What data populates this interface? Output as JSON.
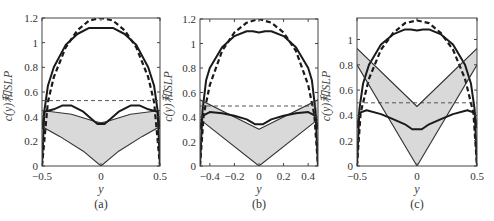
{
  "chart_data": [
    {
      "type": "line",
      "panel": "(a)",
      "xlabel": "y",
      "ylabel": "c(y)和SLP",
      "xlim": [
        -0.5,
        0.5
      ],
      "ylim": [
        0,
        1.2
      ],
      "xticks": [
        "-0.5",
        "0",
        "0.5"
      ],
      "yticks": [
        "0",
        "0.2",
        "0.4",
        "0.6",
        "0.8",
        "1",
        "1.2"
      ],
      "grid": false,
      "series": [
        {
          "name": "elliptic c(y) (dashed)",
          "style": "dashed-thick",
          "x": [
            -0.5,
            -0.45,
            -0.4,
            -0.3,
            -0.2,
            -0.1,
            0,
            0.1,
            0.2,
            0.3,
            0.4,
            0.45,
            0.5
          ],
          "y": [
            0,
            0.52,
            0.72,
            0.96,
            1.1,
            1.18,
            1.2,
            1.18,
            1.1,
            0.96,
            0.72,
            0.52,
            0
          ]
        },
        {
          "name": "c(y) (solid)",
          "style": "solid-thick",
          "x": [
            -0.5,
            -0.48,
            -0.45,
            -0.4,
            -0.3,
            -0.2,
            -0.1,
            0,
            0.1,
            0.2,
            0.3,
            0.4,
            0.45,
            0.48,
            0.5
          ],
          "y": [
            0,
            0.45,
            0.65,
            0.8,
            0.98,
            1.07,
            1.12,
            1.12,
            1.12,
            1.07,
            0.98,
            0.8,
            0.65,
            0.45,
            0
          ]
        },
        {
          "name": "mean SLP (dashed)",
          "style": "dashed-thin",
          "x": [
            -0.5,
            0.5
          ],
          "y": [
            0.53,
            0.53
          ]
        },
        {
          "name": "SLP band upper",
          "style": "solid-thin",
          "x": [
            -0.5,
            -0.25,
            -0.05,
            0,
            0.05,
            0.25,
            0.5
          ],
          "y": [
            0.45,
            0.42,
            0.36,
            0.35,
            0.36,
            0.42,
            0.45
          ]
        },
        {
          "name": "SLP band lower",
          "style": "solid-thin",
          "x": [
            -0.5,
            -0.35,
            -0.15,
            0,
            0.15,
            0.35,
            0.5
          ],
          "y": [
            0.32,
            0.24,
            0.12,
            0,
            0.12,
            0.24,
            0.32
          ]
        },
        {
          "name": "SLP (thick)",
          "style": "solid-thick",
          "x": [
            -0.5,
            -0.48,
            -0.4,
            -0.33,
            -0.25,
            -0.15,
            -0.08,
            -0.03,
            0.03,
            0.08,
            0.15,
            0.25,
            0.33,
            0.4,
            0.48,
            0.5
          ],
          "y": [
            0.3,
            0.44,
            0.46,
            0.49,
            0.49,
            0.44,
            0.38,
            0.34,
            0.34,
            0.38,
            0.44,
            0.49,
            0.49,
            0.46,
            0.44,
            0.3
          ]
        }
      ]
    },
    {
      "type": "line",
      "panel": "(b)",
      "xlabel": "y",
      "ylabel": "c(y)和SLP",
      "xlim": [
        -0.48,
        0.48
      ],
      "ylim": [
        0,
        1.2
      ],
      "xticks": [
        "-0.4",
        "-0.2",
        "0",
        "0.2",
        "0.4"
      ],
      "yticks": [
        "0",
        "0.2",
        "0.4",
        "0.6",
        "0.8",
        "1",
        "1.2"
      ],
      "grid": false,
      "series": [
        {
          "name": "elliptic c(y) (dashed)",
          "style": "dashed-thick",
          "x": [
            -0.48,
            -0.45,
            -0.4,
            -0.3,
            -0.2,
            -0.1,
            0,
            0.1,
            0.2,
            0.3,
            0.4,
            0.45,
            0.48
          ],
          "y": [
            0,
            0.42,
            0.66,
            0.94,
            1.09,
            1.17,
            1.2,
            1.17,
            1.09,
            0.94,
            0.66,
            0.42,
            0
          ]
        },
        {
          "name": "c(y) (solid)",
          "style": "solid-thick",
          "x": [
            -0.48,
            -0.46,
            -0.43,
            -0.4,
            -0.3,
            -0.2,
            -0.1,
            -0.05,
            0,
            0.05,
            0.1,
            0.2,
            0.3,
            0.4,
            0.43,
            0.46,
            0.48
          ],
          "y": [
            0,
            0.45,
            0.7,
            0.8,
            0.97,
            1.06,
            1.1,
            1.1,
            1.09,
            1.1,
            1.1,
            1.06,
            0.97,
            0.8,
            0.7,
            0.45,
            0
          ]
        },
        {
          "name": "mean SLP (dashed)",
          "style": "dashed-thin",
          "x": [
            -0.48,
            0.48
          ],
          "y": [
            0.49,
            0.49
          ]
        },
        {
          "name": "SLP band upper",
          "style": "solid-thin",
          "x": [
            -0.48,
            0,
            0.48
          ],
          "y": [
            0.54,
            0.3,
            0.54
          ]
        },
        {
          "name": "SLP band lower",
          "style": "solid-thin",
          "x": [
            -0.48,
            0,
            0.48
          ],
          "y": [
            0.38,
            0,
            0.38
          ]
        },
        {
          "name": "SLP (thick)",
          "style": "solid-thick",
          "x": [
            -0.48,
            -0.46,
            -0.4,
            -0.3,
            -0.2,
            -0.1,
            -0.03,
            0.03,
            0.1,
            0.2,
            0.3,
            0.4,
            0.46,
            0.48
          ],
          "y": [
            0.3,
            0.41,
            0.44,
            0.43,
            0.41,
            0.38,
            0.34,
            0.34,
            0.38,
            0.41,
            0.43,
            0.44,
            0.41,
            0.3
          ]
        }
      ]
    },
    {
      "type": "line",
      "panel": "(c)",
      "xlabel": "y",
      "ylabel": "c(y)和SLP",
      "xlim": [
        -0.5,
        0.5
      ],
      "ylim": [
        0,
        1.17
      ],
      "xticks": [
        "-0.5",
        "0",
        "0.5"
      ],
      "yticks": [
        "0",
        "0.2",
        "0.4",
        "0.6",
        "0.8",
        "1"
      ],
      "grid": false,
      "series": [
        {
          "name": "elliptic c(y) (dashed)",
          "style": "dashed-thick",
          "x": [
            -0.5,
            -0.47,
            -0.4,
            -0.3,
            -0.2,
            -0.1,
            0,
            0.1,
            0.2,
            0.3,
            0.4,
            0.47,
            0.5
          ],
          "y": [
            0,
            0.42,
            0.69,
            0.92,
            1.05,
            1.13,
            1.15,
            1.13,
            1.05,
            0.92,
            0.69,
            0.42,
            0
          ]
        },
        {
          "name": "c(y) (solid)",
          "style": "solid-thick",
          "x": [
            -0.5,
            -0.48,
            -0.45,
            -0.4,
            -0.3,
            -0.2,
            -0.1,
            -0.05,
            0,
            0.05,
            0.1,
            0.2,
            0.3,
            0.4,
            0.45,
            0.48,
            0.5
          ],
          "y": [
            0,
            0.45,
            0.65,
            0.8,
            0.96,
            1.04,
            1.08,
            1.08,
            1.07,
            1.08,
            1.08,
            1.04,
            0.96,
            0.8,
            0.65,
            0.45,
            0
          ]
        },
        {
          "name": "mean SLP (dashed)",
          "style": "dashed-thin",
          "x": [
            -0.5,
            0.5
          ],
          "y": [
            0.5,
            0.5
          ]
        },
        {
          "name": "SLP band upper",
          "style": "solid-thin",
          "x": [
            -0.5,
            0,
            0.5
          ],
          "y": [
            0.93,
            0.47,
            0.93
          ]
        },
        {
          "name": "SLP band lower",
          "style": "solid-thin",
          "x": [
            -0.5,
            0,
            0.5
          ],
          "y": [
            0.8,
            0,
            0.8
          ]
        },
        {
          "name": "SLP (thick)",
          "style": "solid-thick",
          "x": [
            -0.5,
            -0.48,
            -0.42,
            -0.3,
            -0.2,
            -0.1,
            -0.04,
            0.04,
            0.1,
            0.2,
            0.3,
            0.42,
            0.48,
            0.5
          ],
          "y": [
            0.3,
            0.42,
            0.44,
            0.41,
            0.37,
            0.33,
            0.29,
            0.29,
            0.33,
            0.37,
            0.41,
            0.44,
            0.42,
            0.3
          ]
        }
      ]
    }
  ],
  "panels": [
    {
      "caption": "(a)",
      "xlabel": "y",
      "ylabel": "c(y)和SLP"
    },
    {
      "caption": "(b)",
      "xlabel": "y",
      "ylabel": "c(y)和SLP"
    },
    {
      "caption": "(c)",
      "xlabel": "y",
      "ylabel": "c(y)和SLP"
    }
  ],
  "colors": {
    "band_fill": "#d9d9d9",
    "line": "#1a1a1a",
    "dashed_ref": "#555555",
    "axis": "#444444"
  }
}
